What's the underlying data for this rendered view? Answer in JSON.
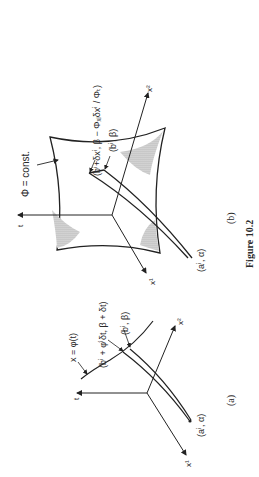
{
  "figure": {
    "caption": "Figure 10.2",
    "panel_b": {
      "label": "(b)",
      "axes": {
        "t": "t",
        "x1": "x¹",
        "x2": "x²"
      },
      "surface_label": "Φ = const.",
      "point_upper": "(bⁱ+δxⁱ, β − Φₓᵢδxⁱ / Φₜ)",
      "point_mid": "(bⁱ, β)",
      "point_start": "(aⁱ, α)"
    },
    "panel_a": {
      "label": "(a)",
      "axes": {
        "t": "t",
        "x1": "x¹",
        "x2": "x²"
      },
      "curve_label": "x = φ(t)",
      "point_upper": "(bⁱ + φ̇ⁱδt, β + δt)",
      "point_mid": "(bⁱ, β)",
      "point_start": "(aⁱ, α)"
    }
  }
}
